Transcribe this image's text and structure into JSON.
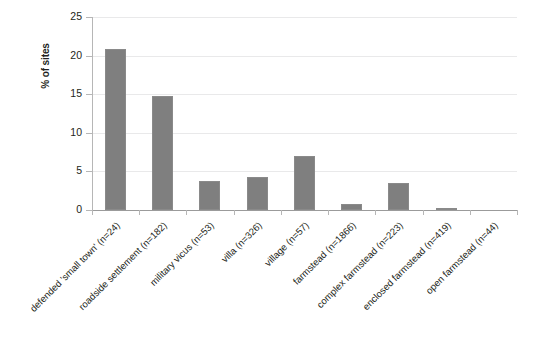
{
  "chart_data": {
    "type": "bar",
    "title": "",
    "subtitle": "",
    "xlabel": "",
    "ylabel": "% of sites",
    "ylim": [
      0,
      25
    ],
    "yticks": [
      0,
      5,
      10,
      15,
      20,
      25
    ],
    "grid": true,
    "legend": false,
    "orientation": "vertical",
    "bar_color": "#7f7f7f",
    "categories": [
      "defended 'small town' (n=24)",
      "roadside settlement (n=182)",
      "military vicus (n=53)",
      "villa (n=326)",
      "village (n=57)",
      "farmstead (n=1866)",
      "complex farmstead (n=223)",
      "enclosed farmstead (n=419)",
      "open farmstead (n=44)"
    ],
    "values": [
      20.8,
      14.8,
      3.8,
      4.3,
      7.0,
      0.8,
      3.5,
      0.3,
      0.0
    ],
    "series": [
      {
        "name": "% of sites",
        "values": [
          20.8,
          14.8,
          3.8,
          4.3,
          7.0,
          0.8,
          3.5,
          0.3,
          0.0
        ]
      }
    ]
  },
  "axis": {
    "y_title": "% of sites",
    "y_tick_labels": [
      "0",
      "5",
      "10",
      "15",
      "20",
      "25"
    ]
  },
  "colors": {
    "bar": "#7f7f7f",
    "bar_edge": "#8a8a8a",
    "grid": "#e9e9ea",
    "axis": "#b6b6b6",
    "text": "#231f20",
    "background": "#ffffff"
  }
}
